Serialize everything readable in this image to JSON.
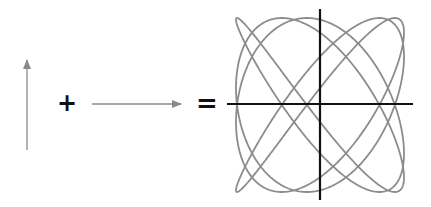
{
  "diagram": {
    "title": "",
    "operators": {
      "plus": "+",
      "equals": "="
    },
    "colors": {
      "arrow": "#8a8a8a",
      "curve": "#8c8c8c",
      "axes": "#111111",
      "operators": "#111111",
      "background": "#ffffff"
    },
    "vertical_arrow": {
      "x": 27,
      "y_tail": 150,
      "y_tip": 60,
      "direction": "up"
    },
    "horizontal_arrow": {
      "y": 104,
      "x_tail": 92,
      "x_tip": 181,
      "direction": "right"
    },
    "lissajous": {
      "center_x": 320,
      "center_y": 105,
      "amplitude_x": 84,
      "amplitude_y": 87,
      "freq_x": 4,
      "freq_y": 5,
      "phase": 0.785,
      "stroke_width": 1.8
    },
    "axes": {
      "horizontal": {
        "y": 104,
        "x1": 227,
        "x2": 413
      },
      "vertical": {
        "x": 320,
        "y1": 9,
        "y2": 200
      }
    }
  }
}
